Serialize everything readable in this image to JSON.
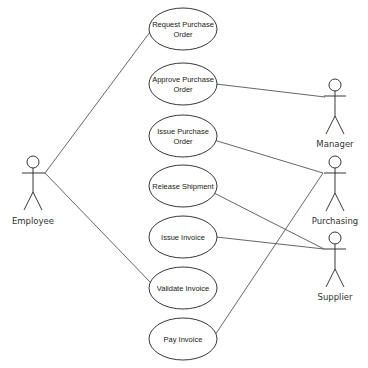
{
  "diagram": {
    "type": "uml-use-case",
    "actors": [
      {
        "id": "employee",
        "label": "Employee"
      },
      {
        "id": "manager",
        "label": "Manager"
      },
      {
        "id": "purchasing",
        "label": "Purchasing"
      },
      {
        "id": "supplier",
        "label": "Supplier"
      }
    ],
    "use_cases": [
      {
        "id": "request_po",
        "line1": "Request Purchase",
        "line2": "Order"
      },
      {
        "id": "approve_po",
        "line1": "Approve Purchase",
        "line2": "Order"
      },
      {
        "id": "issue_po",
        "line1": "Issue Purchase",
        "line2": "Order"
      },
      {
        "id": "release_shipment",
        "line1": "Release Shipment",
        "line2": ""
      },
      {
        "id": "issue_invoice",
        "line1": "Issue Invoice",
        "line2": ""
      },
      {
        "id": "validate_invoice",
        "line1": "Validate Invoice",
        "line2": ""
      },
      {
        "id": "pay_invoice",
        "line1": "Pay Invoice",
        "line2": ""
      }
    ],
    "associations": [
      [
        "employee",
        "request_po"
      ],
      [
        "employee",
        "validate_invoice"
      ],
      [
        "manager",
        "approve_po"
      ],
      [
        "purchasing",
        "issue_po"
      ],
      [
        "purchasing",
        "pay_invoice"
      ],
      [
        "supplier",
        "release_shipment"
      ],
      [
        "supplier",
        "issue_invoice"
      ]
    ]
  }
}
